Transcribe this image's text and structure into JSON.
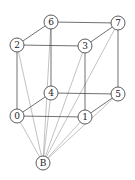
{
  "diagram": {
    "nodes": [
      {
        "id": "0",
        "label": "0",
        "x": 17,
        "y": 116
      },
      {
        "id": "1",
        "label": "1",
        "x": 85,
        "y": 117
      },
      {
        "id": "2",
        "label": "2",
        "x": 17,
        "y": 45
      },
      {
        "id": "3",
        "label": "3",
        "x": 85,
        "y": 46
      },
      {
        "id": "4",
        "label": "4",
        "x": 51,
        "y": 93
      },
      {
        "id": "5",
        "label": "5",
        "x": 118,
        "y": 94
      },
      {
        "id": "6",
        "label": "6",
        "x": 51,
        "y": 22
      },
      {
        "id": "7",
        "label": "7",
        "x": 118,
        "y": 23
      },
      {
        "id": "B",
        "label": "B",
        "x": 43,
        "y": 163
      }
    ],
    "cube_edges": [
      [
        "6",
        "2"
      ],
      [
        "6",
        "7"
      ],
      [
        "2",
        "3"
      ],
      [
        "3",
        "7"
      ],
      [
        "4",
        "0"
      ],
      [
        "4",
        "5"
      ],
      [
        "0",
        "1"
      ],
      [
        "1",
        "5"
      ],
      [
        "2",
        "0"
      ],
      [
        "6",
        "4"
      ],
      [
        "3",
        "1"
      ],
      [
        "7",
        "5"
      ]
    ],
    "apex_edges": [
      [
        "B",
        "0"
      ],
      [
        "B",
        "1"
      ],
      [
        "B",
        "2"
      ],
      [
        "B",
        "3"
      ],
      [
        "B",
        "4"
      ],
      [
        "B",
        "5"
      ],
      [
        "B",
        "6"
      ],
      [
        "B",
        "7"
      ]
    ],
    "colors": {
      "cube_edge": "#333333",
      "apex_edge": "#999999",
      "node_stroke": "#333333",
      "node_fill": "#ffffff"
    },
    "node_radius": 7
  }
}
